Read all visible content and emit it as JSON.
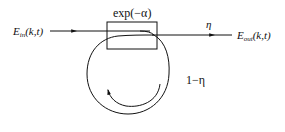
{
  "diagram": {
    "type": "ring-resonator-schematic",
    "input_label": {
      "main": "E",
      "sub": "in",
      "args": "(k,t)"
    },
    "output_label": {
      "main": "E",
      "sub": "out",
      "args": "(k,t)"
    },
    "attenuator_label": "exp(−α)",
    "coupling_label": "η",
    "loop_label": "1−η",
    "colors": {
      "stroke": "#111111",
      "background": "#ffffff"
    }
  }
}
